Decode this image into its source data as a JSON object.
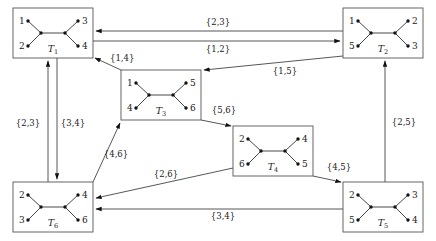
{
  "diagram": {
    "type": "tree-rearrangement-graph",
    "trees": [
      {
        "id": "T1",
        "name": "T",
        "sub": "1",
        "leaves": {
          "tl": "1",
          "bl": "2",
          "tr": "3",
          "br": "4"
        },
        "box": [
          13,
          8,
          80,
          50
        ]
      },
      {
        "id": "T2",
        "name": "T",
        "sub": "2",
        "leaves": {
          "tl": "1",
          "bl": "5",
          "tr": "2",
          "br": "3"
        },
        "box": [
          343,
          8,
          80,
          50
        ]
      },
      {
        "id": "T3",
        "name": "T",
        "sub": "3",
        "leaves": {
          "tl": "1",
          "bl": "4",
          "tr": "5",
          "br": "6"
        },
        "box": [
          121,
          70,
          80,
          50
        ]
      },
      {
        "id": "T4",
        "name": "T",
        "sub": "4",
        "leaves": {
          "tl": "2",
          "bl": "6",
          "tr": "4",
          "br": "5"
        },
        "box": [
          233,
          126,
          80,
          50
        ]
      },
      {
        "id": "T5",
        "name": "T",
        "sub": "5",
        "leaves": {
          "tl": "2",
          "bl": "5",
          "tr": "3",
          "br": "4"
        },
        "box": [
          343,
          182,
          80,
          50
        ]
      },
      {
        "id": "T6",
        "name": "T",
        "sub": "6",
        "leaves": {
          "tl": "2",
          "bl": "3",
          "tr": "4",
          "br": "6"
        },
        "box": [
          13,
          182,
          80,
          50
        ]
      }
    ],
    "edges": [
      {
        "from": "T2",
        "to": "T1",
        "label": "{2,3}"
      },
      {
        "from": "T1",
        "to": "T2",
        "label": "{1,2}"
      },
      {
        "from": "T3",
        "to": "T1",
        "label": "{1,4}"
      },
      {
        "from": "T2",
        "to": "T3",
        "label": "{1,5}"
      },
      {
        "from": "T6",
        "to": "T1",
        "label": "{2,3}"
      },
      {
        "from": "T1",
        "to": "T6",
        "label": "{3,4}"
      },
      {
        "from": "T3",
        "to": "T4",
        "label": "{5,6}"
      },
      {
        "from": "T6",
        "to": "T3",
        "label": "{4,6}"
      },
      {
        "from": "T4",
        "to": "T5",
        "label": "{4,5}"
      },
      {
        "from": "T4",
        "to": "T6",
        "label": "{2,6}"
      },
      {
        "from": "T5",
        "to": "T6",
        "label": "{3,4}"
      },
      {
        "from": "T5",
        "to": "T2",
        "label": "{2,5}"
      }
    ]
  }
}
